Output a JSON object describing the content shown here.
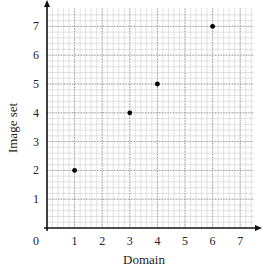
{
  "chart_data": {
    "type": "scatter",
    "title": "",
    "xlabel": "Domain",
    "ylabel": "Image set",
    "xlim": [
      0,
      7.5
    ],
    "ylim": [
      0,
      7.5
    ],
    "grid": true,
    "x_ticks": [
      "0",
      "1",
      "2",
      "3",
      "4",
      "5",
      "6",
      "7"
    ],
    "y_ticks": [
      "1",
      "2",
      "3",
      "4",
      "5",
      "6",
      "7"
    ],
    "points": [
      {
        "x": 1,
        "y": 2
      },
      {
        "x": 3,
        "y": 4
      },
      {
        "x": 4,
        "y": 5
      },
      {
        "x": 6,
        "y": 7
      }
    ],
    "colors": {
      "axis": "#111111",
      "grid_minor": "#cfcfcf",
      "grid_major": "#9a9a9a",
      "point": "#000000"
    }
  }
}
